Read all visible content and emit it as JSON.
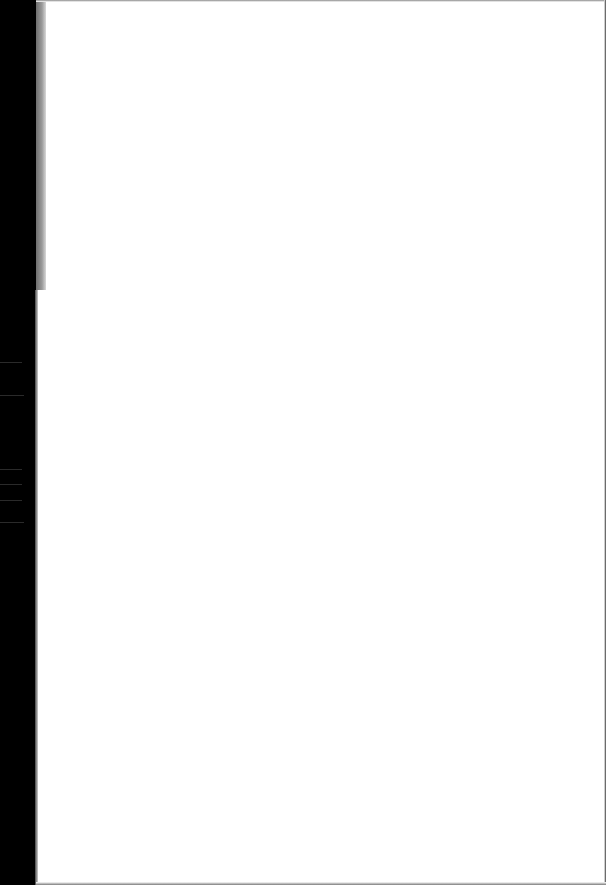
{
  "page": {
    "content": "",
    "is_blank": true
  },
  "colors": {
    "paper": "#ffffff",
    "scanner_border": "#000000",
    "edge_shadow": "#8a8a8a"
  },
  "scan_lines": [
    {
      "top": 362,
      "width": 22
    },
    {
      "top": 395,
      "width": 24
    },
    {
      "top": 469,
      "width": 22
    },
    {
      "top": 484,
      "width": 22
    },
    {
      "top": 500,
      "width": 22
    },
    {
      "top": 522,
      "width": 24
    }
  ]
}
